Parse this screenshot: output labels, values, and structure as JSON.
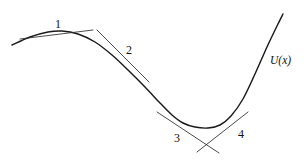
{
  "figure": {
    "kind": "curve-with-tangents",
    "background_color": "#ffffff",
    "curve_color": "#1a1a1a",
    "tangent_color": "#2a2a2a",
    "label_color": "#111111",
    "function_label": "U(x)",
    "point_labels": [
      "1",
      "2",
      "3",
      "4"
    ]
  },
  "chart_data": {
    "type": "line",
    "title": "",
    "subtitle": "",
    "xlabel": "",
    "ylabel": "",
    "legend": [],
    "grid": false,
    "axes_visible": false,
    "series": [
      {
        "name": "U(x)",
        "label": "U(x)",
        "label_position": {
          "x": 270,
          "y": 55
        },
        "description": "Smooth potential energy curve: rises to a local maximum near x=60, descends through an inflection, flattens at a minimum near x=200, then rises steeply at the right edge.",
        "points": [
          {
            "x": 12,
            "y": 45
          },
          {
            "x": 30,
            "y": 37
          },
          {
            "x": 48,
            "y": 32
          },
          {
            "x": 62,
            "y": 31
          },
          {
            "x": 78,
            "y": 34
          },
          {
            "x": 95,
            "y": 42
          },
          {
            "x": 112,
            "y": 55
          },
          {
            "x": 128,
            "y": 70
          },
          {
            "x": 145,
            "y": 87
          },
          {
            "x": 160,
            "y": 103
          },
          {
            "x": 172,
            "y": 115
          },
          {
            "x": 183,
            "y": 123
          },
          {
            "x": 195,
            "y": 127
          },
          {
            "x": 208,
            "y": 128
          },
          {
            "x": 220,
            "y": 125
          },
          {
            "x": 231,
            "y": 116
          },
          {
            "x": 243,
            "y": 99
          },
          {
            "x": 255,
            "y": 74
          },
          {
            "x": 267,
            "y": 47
          },
          {
            "x": 277,
            "y": 26
          },
          {
            "x": 283,
            "y": 14
          }
        ]
      }
    ],
    "annotations": [
      {
        "id": "point-1",
        "label": "1",
        "label_position": {
          "x": 55,
          "y": 18
        },
        "curve_point": {
          "x": 59,
          "y": 31
        },
        "slope_sign": "zero",
        "description": "Local maximum — tangent is horizontal",
        "tangent": {
          "x1": 20,
          "y1": 39,
          "x2": 93,
          "y2": 30
        }
      },
      {
        "id": "point-2",
        "label": "2",
        "label_position": {
          "x": 126,
          "y": 44
        },
        "curve_point": {
          "x": 120,
          "y": 62
        },
        "slope_sign": "negative",
        "description": "Inflection region — steep negative slope",
        "tangent": {
          "x1": 97,
          "y1": 30,
          "x2": 149,
          "y2": 82
        }
      },
      {
        "id": "point-3",
        "label": "3",
        "label_position": {
          "x": 174,
          "y": 132
        },
        "curve_point": {
          "x": 181,
          "y": 122
        },
        "slope_sign": "negative",
        "description": "Approaching the minimum — shallow negative slope",
        "tangent": {
          "x1": 157,
          "y1": 112,
          "x2": 219,
          "y2": 153
        }
      },
      {
        "id": "point-4",
        "label": "4",
        "label_position": {
          "x": 238,
          "y": 128
        },
        "curve_point": {
          "x": 226,
          "y": 122
        },
        "slope_sign": "positive",
        "description": "Leaving the minimum — shallow positive slope",
        "tangent": {
          "x1": 197,
          "y1": 152,
          "x2": 248,
          "y2": 112
        }
      }
    ],
    "xlim": [
      0,
      304
    ],
    "ylim": [
      161,
      0
    ]
  }
}
